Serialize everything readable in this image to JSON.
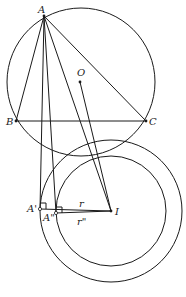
{
  "diagram": {
    "type": "geometry",
    "points": [
      {
        "id": "A",
        "label": "A",
        "x": 44,
        "y": 16
      },
      {
        "id": "B",
        "label": "B",
        "x": 16,
        "y": 121
      },
      {
        "id": "C",
        "label": "C",
        "x": 146,
        "y": 121
      },
      {
        "id": "O",
        "label": "O",
        "x": 80,
        "y": 82
      },
      {
        "id": "I",
        "label": "I",
        "x": 111,
        "y": 211
      },
      {
        "id": "A1",
        "label": "A'",
        "x": 40,
        "y": 209
      },
      {
        "id": "A2",
        "label": "A\"",
        "x": 56,
        "y": 213
      }
    ],
    "circles": [
      {
        "id": "circumcircle",
        "center": "O",
        "cx": 81,
        "cy": 82,
        "r": 74
      },
      {
        "id": "outer-circle",
        "center": "I",
        "cx": 111,
        "cy": 211,
        "r": 71
      },
      {
        "id": "inner-circle",
        "center": "I",
        "cx": 111,
        "cy": 211,
        "r": 55
      }
    ],
    "segments": [
      [
        "A",
        "B"
      ],
      [
        "A",
        "C"
      ],
      [
        "B",
        "C"
      ],
      [
        "A",
        "A1"
      ],
      [
        "A",
        "A2"
      ],
      [
        "A",
        "I"
      ],
      [
        "O",
        "I"
      ],
      [
        "A1",
        "I"
      ],
      [
        "A2",
        "I"
      ]
    ],
    "segment_labels": [
      {
        "text": "r",
        "x": 79,
        "y": 207
      },
      {
        "text": "r\"",
        "x": 77,
        "y": 225
      }
    ]
  }
}
